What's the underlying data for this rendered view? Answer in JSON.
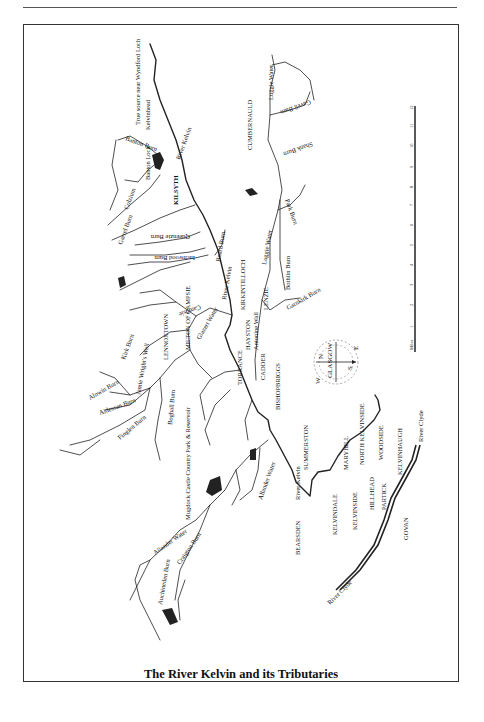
{
  "page": {
    "caption": "The River Kelvin and its Tributaries"
  },
  "map": {
    "rivers": [
      {
        "name": "River Kelvin",
        "label": "River Kelvin"
      },
      {
        "name": "River Clyde",
        "label": "River Clyde"
      }
    ],
    "labels": {
      "source": "True source near Wyndford Loch",
      "kelvinhead": "Kelvinhead",
      "kelvin_upper": "River Kelvin",
      "kelvin_mid": "River Kelvin",
      "kelvin_lower": "River Kelvin",
      "banton_burn": "Banton Burn",
      "banton_loch": "Banton Loch",
      "kilsyth": "KILSYTH",
      "garrel_burn": "Garrel Burn",
      "colzium": "Colzium",
      "queenzie_burn": "Queenzie Burn",
      "board_burn": "Board Burn",
      "inchwood_burn": "Inchwood Burn",
      "kirkintilloch": "KIRKINTILLOCH",
      "cumbernauld": "CUMBERNAULD",
      "luggie_water_upper": "Luggie Water",
      "luggie_water": "Luggie Water",
      "shank_burn": "Shank Burn",
      "bothlin_burn": "Bothlin Burn",
      "gavell_burn": "Gavell Burn",
      "park_burn": "Park Burn",
      "garnkirk_burn": "Garnkirk Burn",
      "lenzie": "LENZIE",
      "antonine_wall": "Antonine Wall",
      "haystoun": "HAYSTON",
      "torrance": "TORRANCE",
      "cadder": "CADDER",
      "bishopbriggs": "BISHOPBRIGGS",
      "glazert_water": "Glazert Water",
      "campsie": "Campsie",
      "milton": "MILTON OF CAMPSIE",
      "lennoxtown": "LENNOXTOWN",
      "kirk_burn": "Kirk Burn",
      "jamie_wrights_well": "Jamie Wright's Well",
      "alnwin_burn": "Alnwin Burn",
      "aldessan_burn": "Aldessan Burn",
      "finglen_burn": "Finglen Burn",
      "boghall_burn": "Boghall Burn",
      "mugdock": "Mugdock Castle Country Park & Reservoir",
      "allander_water_upper": "Allander Water",
      "allander_water": "Allander Water",
      "craigton_burn": "Craigton Burn",
      "auchineden_burn": "Auchineden Burn",
      "summerston": "SUMMERSTON",
      "bearsden": "BEARSDEN",
      "maryhill": "MARYHILL",
      "kelvindale": "KELVINDALE",
      "north_kelvinside": "NORTH KELVINSIDE",
      "kelvinside": "KELVINSIDE",
      "woodside": "WOODSIDE",
      "hillhead": "HILLHEAD",
      "partick": "PARTICK",
      "kelvinhaugh": "KELVINHAUGH",
      "govan": "GOVAN",
      "river_clyde_upper": "River Clyde",
      "river_clyde_lower": "River Clyde"
    },
    "compass": {
      "center": "GLASGOW",
      "n": "N",
      "e": "E",
      "s": "S",
      "w": "W"
    },
    "scale": {
      "unit": "Miles",
      "ticks": [
        "1",
        "2",
        "3",
        "4",
        "5",
        "6",
        "7",
        "8",
        "9",
        "10",
        "11",
        "12"
      ]
    }
  }
}
